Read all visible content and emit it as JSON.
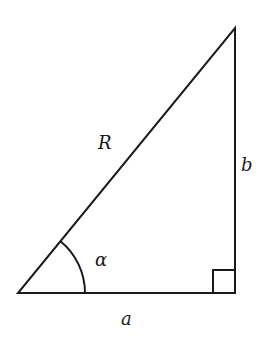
{
  "diagram": {
    "type": "right-triangle",
    "stroke_color": "#1a1a1a",
    "vertices": {
      "bottom_left": [
        18,
        293
      ],
      "bottom_right": [
        235,
        293
      ],
      "top": [
        235,
        28
      ]
    },
    "labels": {
      "hypotenuse": "R",
      "vertical_leg": "b",
      "horizontal_leg": "a",
      "angle": "α"
    },
    "angle_marker": "arc at bottom-left vertex",
    "right_angle_marker": "square at bottom-right vertex"
  }
}
